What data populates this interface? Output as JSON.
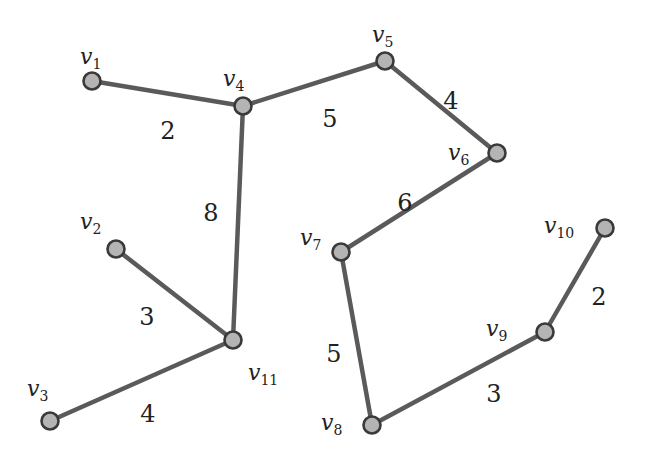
{
  "graph": {
    "type": "weighted-undirected-forest",
    "colors": {
      "edge": "#5a5a5a",
      "node_fill": "#b4b4b4",
      "node_stroke": "#3a3a3a",
      "text": "#222222"
    },
    "nodes": [
      {
        "id": "v1",
        "base": "v",
        "sub": "1",
        "x": 92,
        "y": 81,
        "lx": 80,
        "ly": 64
      },
      {
        "id": "v2",
        "base": "v",
        "sub": "2",
        "x": 116,
        "y": 249,
        "lx": 80,
        "ly": 229
      },
      {
        "id": "v3",
        "base": "v",
        "sub": "3",
        "x": 50,
        "y": 421,
        "lx": 27,
        "ly": 396
      },
      {
        "id": "v4",
        "base": "v",
        "sub": "4",
        "x": 243,
        "y": 106,
        "lx": 223,
        "ly": 86
      },
      {
        "id": "v5",
        "base": "v",
        "sub": "5",
        "x": 385,
        "y": 61,
        "lx": 372,
        "ly": 42
      },
      {
        "id": "v6",
        "base": "v",
        "sub": "6",
        "x": 497,
        "y": 153,
        "lx": 448,
        "ly": 160
      },
      {
        "id": "v7",
        "base": "v",
        "sub": "7",
        "x": 341,
        "y": 252,
        "lx": 300,
        "ly": 245
      },
      {
        "id": "v8",
        "base": "v",
        "sub": "8",
        "x": 372,
        "y": 425,
        "lx": 321,
        "ly": 430
      },
      {
        "id": "v9",
        "base": "v",
        "sub": "9",
        "x": 545,
        "y": 332,
        "lx": 486,
        "ly": 336
      },
      {
        "id": "v10",
        "base": "v",
        "sub": "10",
        "x": 605,
        "y": 228,
        "lx": 544,
        "ly": 233
      },
      {
        "id": "v11",
        "base": "v",
        "sub": "11",
        "x": 233,
        "y": 340,
        "lx": 248,
        "ly": 380
      }
    ],
    "edges": [
      {
        "from": "v1",
        "to": "v4",
        "weight": "2",
        "lx": 168,
        "ly": 132
      },
      {
        "from": "v4",
        "to": "v5",
        "weight": "5",
        "lx": 330,
        "ly": 120
      },
      {
        "from": "v5",
        "to": "v6",
        "weight": "4",
        "lx": 451,
        "ly": 102
      },
      {
        "from": "v4",
        "to": "v11",
        "weight": "8",
        "lx": 211,
        "ly": 214
      },
      {
        "from": "v2",
        "to": "v11",
        "weight": "3",
        "lx": 147,
        "ly": 318
      },
      {
        "from": "v3",
        "to": "v11",
        "weight": "4",
        "lx": 148,
        "ly": 415
      },
      {
        "from": "v6",
        "to": "v7",
        "weight": "6",
        "lx": 405,
        "ly": 204
      },
      {
        "from": "v7",
        "to": "v8",
        "weight": "5",
        "lx": 334,
        "ly": 355
      },
      {
        "from": "v8",
        "to": "v9",
        "weight": "3",
        "lx": 494,
        "ly": 395
      },
      {
        "from": "v9",
        "to": "v10",
        "weight": "2",
        "lx": 599,
        "ly": 298
      }
    ]
  }
}
